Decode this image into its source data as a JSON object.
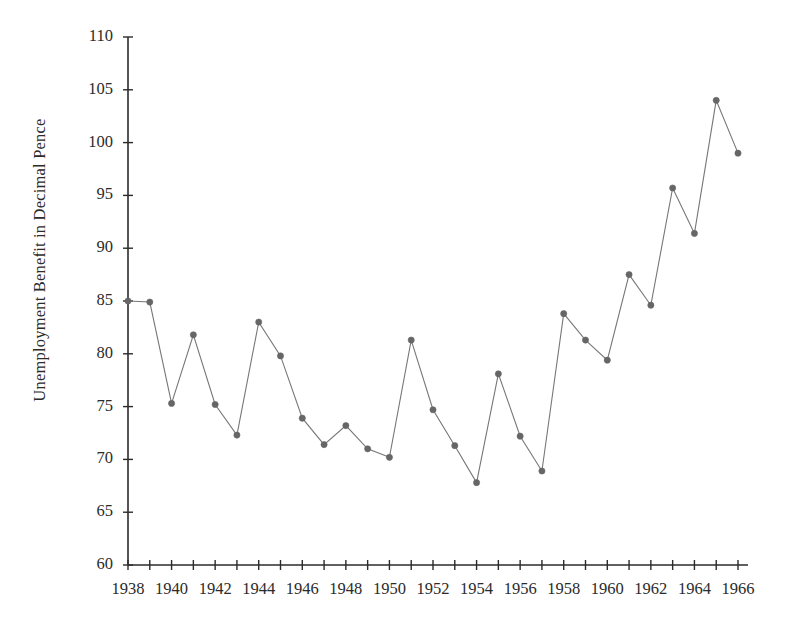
{
  "chart_data": {
    "type": "line",
    "title": "",
    "xlabel": "",
    "ylabel": "Unemployment Benefit in Decimal Pence",
    "xlim": [
      1938,
      1966
    ],
    "ylim": [
      60,
      110
    ],
    "grid": false,
    "legend": null,
    "x_tick_labels": [
      "1938",
      "1940",
      "1942",
      "1944",
      "1946",
      "1948",
      "1950",
      "1952",
      "1954",
      "1956",
      "1958",
      "1960",
      "1962",
      "1964",
      "1966"
    ],
    "x_tick_values": [
      1938,
      1940,
      1942,
      1944,
      1946,
      1948,
      1950,
      1952,
      1954,
      1956,
      1958,
      1960,
      1962,
      1964,
      1966
    ],
    "x_minor_ticks_every": 1,
    "y_tick_labels": [
      "60",
      "65",
      "70",
      "75",
      "80",
      "85",
      "90",
      "95",
      "100",
      "105",
      "110"
    ],
    "y_tick_values": [
      60,
      65,
      70,
      75,
      80,
      85,
      90,
      95,
      100,
      105,
      110
    ],
    "x": [
      1938,
      1939,
      1940,
      1941,
      1942,
      1943,
      1944,
      1945,
      1946,
      1947,
      1948,
      1949,
      1950,
      1951,
      1952,
      1953,
      1954,
      1955,
      1956,
      1957,
      1958,
      1959,
      1960,
      1961,
      1962,
      1963,
      1964,
      1965,
      1966
    ],
    "values": [
      85.0,
      84.9,
      75.3,
      81.8,
      75.2,
      72.3,
      83.0,
      79.8,
      73.9,
      71.4,
      73.2,
      71.0,
      70.2,
      81.3,
      74.7,
      71.3,
      67.8,
      78.1,
      72.2,
      68.9,
      83.8,
      81.3,
      79.4,
      87.5,
      84.6,
      95.7,
      91.4,
      104.0,
      99.0
    ],
    "series_name": "Unemployment Benefit",
    "line_color": "#777777",
    "marker_color": "#666666",
    "axis_color": "#2b2b2b",
    "marker_style": "circle"
  }
}
